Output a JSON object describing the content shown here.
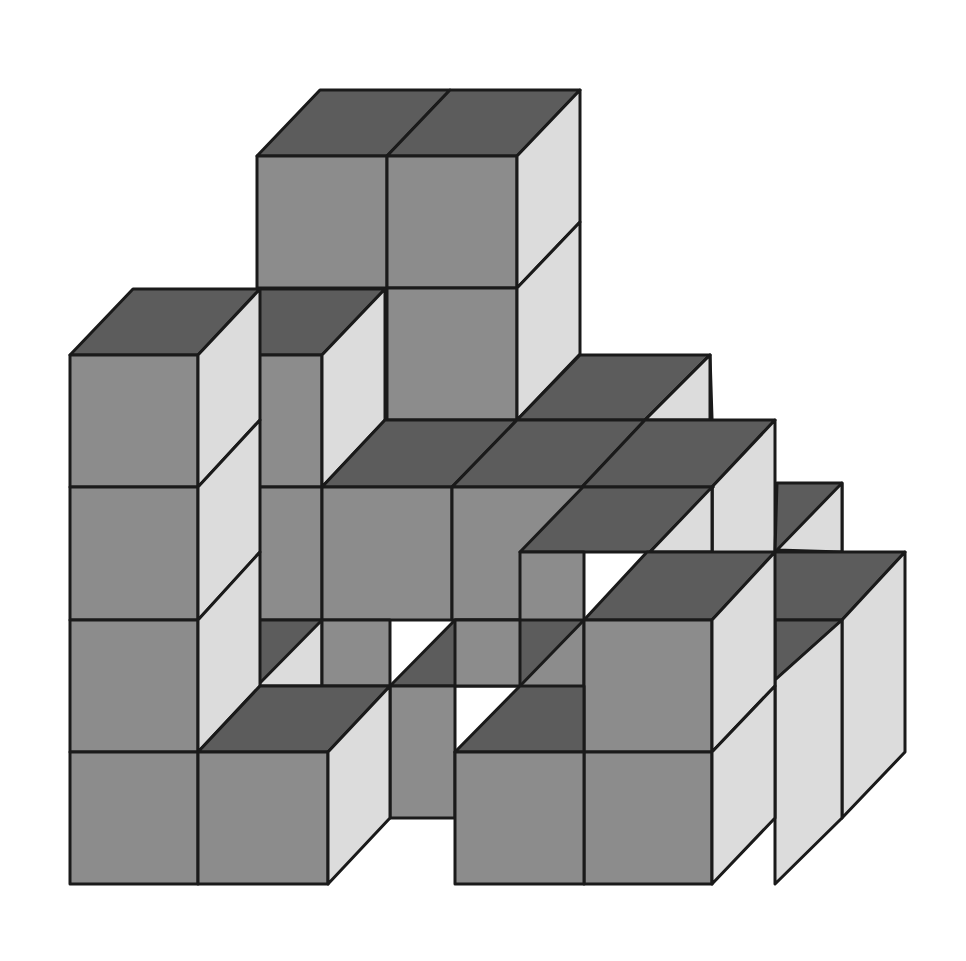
{
  "figure": {
    "colors": {
      "top": "#5c5c5c",
      "front": "#8c8c8c",
      "side": "#dcdcdc",
      "edge": "#1a1a1a",
      "background": "#ffffff"
    },
    "faces": [
      {
        "t": "top",
        "p": "257,156 387,156 450,90 320,90"
      },
      {
        "t": "top",
        "p": "387,156 517,156 580,90 450,90"
      },
      {
        "t": "front",
        "p": "257,156 387,156 387,288 257,288"
      },
      {
        "t": "front",
        "p": "387,156 517,156 517,288 387,288"
      },
      {
        "t": "front",
        "p": "387,288 517,288 517,420 387,420"
      },
      {
        "t": "side",
        "p": "517,156 580,90 580,222 517,288"
      },
      {
        "t": "side",
        "p": "517,288 580,222 580,354 517,420"
      },
      {
        "t": "top",
        "p": "517,420 645,420 710,355 580,355"
      },
      {
        "t": "top",
        "p": "645,420 712,420 712,418 710,355"
      },
      {
        "t": "side",
        "p": "645,420 710,355 710,420"
      },
      {
        "t": "top",
        "p": "257,355 322,355 385,289 257,289"
      },
      {
        "t": "front",
        "p": "257,355 322,355 322,487 257,487"
      },
      {
        "t": "front",
        "p": "257,487 322,487 322,620 257,620"
      },
      {
        "t": "side",
        "p": "322,355 385,289 385,420 322,487"
      },
      {
        "t": "top",
        "p": "322,487 452,487 517,420 385,420"
      },
      {
        "t": "top",
        "p": "452,487 582,487 645,420 517,420"
      },
      {
        "t": "top",
        "p": "582,487 712,487 775,420 645,420"
      },
      {
        "t": "front",
        "p": "322,487 452,487 452,620 322,620"
      },
      {
        "t": "front",
        "p": "452,487 582,487 582,620 452,620"
      },
      {
        "t": "side",
        "p": "712,487 775,420 775,552 712,620"
      },
      {
        "t": "top",
        "p": "775,552 842,552 842,483 777,483"
      },
      {
        "t": "side",
        "p": "777,550 842,483 842,552"
      },
      {
        "t": "top",
        "p": "520,552 650,552 713,487 583,487"
      },
      {
        "t": "top",
        "p": "650,552 712,552 712,487 713,487"
      },
      {
        "t": "front",
        "p": "520,552 584,552 584,752 520,752"
      },
      {
        "t": "side",
        "p": "650,552 712,487 712,552"
      },
      {
        "t": "top",
        "p": "257,686 322,686 322,620 257,620"
      },
      {
        "t": "side",
        "p": "257,686 322,620 322,686"
      },
      {
        "t": "front",
        "p": "322,620 390,620 390,686 322,686"
      },
      {
        "t": "top",
        "p": "390,686 520,686 584,620 455,620"
      },
      {
        "t": "front",
        "p": "390,686 455,686 455,818 390,818"
      },
      {
        "t": "front",
        "p": "455,620 520,620 520,686 455,686"
      },
      {
        "t": "top",
        "p": "712,620 842,620 905,552 775,552"
      },
      {
        "t": "side",
        "p": "842,620 905,552 905,752 842,818"
      },
      {
        "t": "top",
        "p": "775,620 842,620 775,680"
      },
      {
        "t": "side",
        "p": "775,680 842,620 842,818 775,884"
      },
      {
        "t": "top",
        "p": "584,620 712,620 775,552 647,552"
      },
      {
        "t": "front",
        "p": "584,620 712,620 712,752 584,752"
      },
      {
        "t": "front",
        "p": "584,752 712,752 712,884 584,884"
      },
      {
        "t": "side",
        "p": "712,620 775,552 775,686 712,752"
      },
      {
        "t": "side",
        "p": "712,752 775,686 775,818 712,884"
      },
      {
        "t": "top",
        "p": "455,752 584,752 584,686 520,686"
      },
      {
        "t": "front",
        "p": "455,752 584,752 584,884 455,884"
      },
      {
        "t": "top",
        "p": "70,355 198,355 260,289 133,289"
      },
      {
        "t": "front",
        "p": "70,355 198,355 198,487 70,487"
      },
      {
        "t": "front",
        "p": "70,487 198,487 198,620 70,620"
      },
      {
        "t": "front",
        "p": "70,620 198,620 198,752 70,752"
      },
      {
        "t": "front",
        "p": "70,752 198,752 198,884 70,884"
      },
      {
        "t": "side",
        "p": "198,355 260,289 260,420 198,487"
      },
      {
        "t": "side",
        "p": "198,487 260,420 260,552 198,620"
      },
      {
        "t": "side",
        "p": "198,620 260,552 260,686 198,752"
      },
      {
        "t": "top",
        "p": "198,752 328,752 390,686 260,686"
      },
      {
        "t": "front",
        "p": "198,752 328,752 328,884 198,884"
      },
      {
        "t": "side",
        "p": "328,752 390,686 390,818 328,884"
      }
    ]
  }
}
